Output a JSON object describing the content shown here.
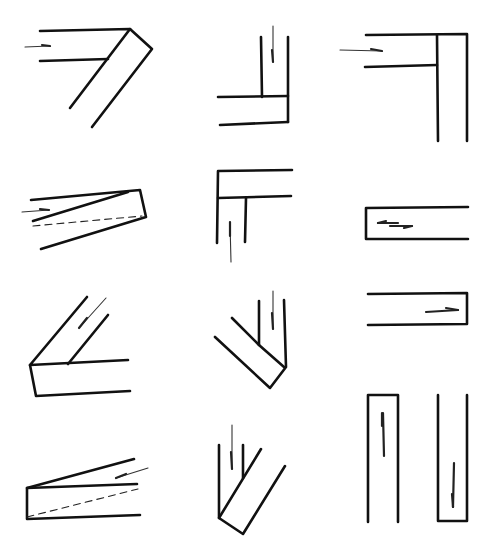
{
  "diagram": {
    "header_text_cropped": "",
    "colors": {
      "line": "#111111",
      "background": "#ffffff",
      "dashed": "#222222"
    },
    "figures": [
      {
        "id": 1,
        "row": 1,
        "col": 1,
        "shape": "angled-joint-right-diagonal",
        "arrow": "horizontal-right",
        "dashed": false
      },
      {
        "id": 2,
        "row": 1,
        "col": 2,
        "shape": "vertical-into-horizontal-L",
        "arrow": "vertical-down",
        "dashed": false
      },
      {
        "id": 3,
        "row": 1,
        "col": 3,
        "shape": "horizontal-into-vertical-T-corner",
        "arrow": "horizontal-right",
        "dashed": false
      },
      {
        "id": 4,
        "row": 2,
        "col": 1,
        "shape": "tapered-wedge-joint",
        "arrow": "horizontal-right",
        "dashed": true
      },
      {
        "id": 5,
        "row": 2,
        "col": 2,
        "shape": "inverted-L-corner",
        "arrow": "vertical-down",
        "dashed": false
      },
      {
        "id": 6,
        "row": 2,
        "col": 3,
        "shape": "closed-left-channel",
        "arrow": "double-half-arrow-horizontal",
        "dashed": false
      },
      {
        "id": 7,
        "row": 3,
        "col": 1,
        "shape": "diagonal-into-horizontal-channel",
        "arrow": "diagonal-down-left",
        "dashed": false
      },
      {
        "id": 8,
        "row": 3,
        "col": 2,
        "shape": "vertical-into-diagonal-channel",
        "arrow": "vertical-down",
        "dashed": false
      },
      {
        "id": 9,
        "row": 3,
        "col": 3,
        "shape": "closed-right-channel",
        "arrow": "horizontal-right",
        "dashed": false
      },
      {
        "id": 10,
        "row": 4,
        "col": 1,
        "shape": "tapered-wedge-closed-left",
        "arrow": "diagonal-up-right",
        "dashed": true
      },
      {
        "id": 11,
        "row": 4,
        "col": 2,
        "shape": "vertical-into-diagonal-down-right",
        "arrow": "vertical-down",
        "dashed": false
      },
      {
        "id": 12,
        "row": 4,
        "col": 3,
        "shape": "pair-of-vertical-channels-closed-top-and-bottom",
        "arrow": "vertical-up-and-down",
        "dashed": false
      }
    ]
  }
}
